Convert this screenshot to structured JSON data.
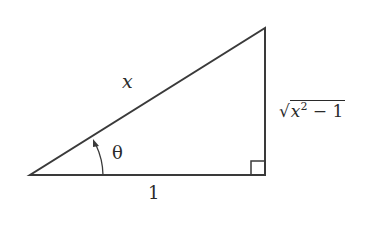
{
  "diagram": {
    "type": "right-triangle",
    "hypotenuse_label": "x",
    "adjacent_label": "1",
    "opposite_label": {
      "radical": "√",
      "base": "x",
      "exponent": "2",
      "rest": " − 1"
    },
    "angle_label": "θ",
    "stroke_color": "#3a3a3a"
  }
}
